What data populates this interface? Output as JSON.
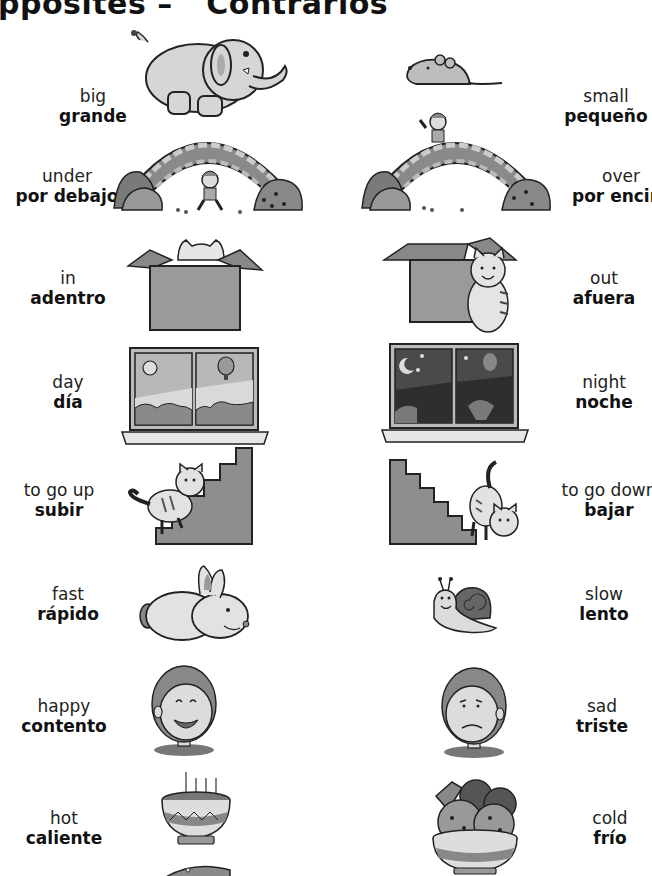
{
  "page": {
    "title_left": "pposites",
    "title_right": "Contrarios"
  },
  "colors": {
    "background": "#ffffff",
    "text": "#111111",
    "light_gray": "#d6d6d6",
    "mid_gray": "#9a9a9a",
    "dark_gray": "#6e6e6e",
    "outline": "#222222"
  },
  "pairs": [
    {
      "left": {
        "en": "big",
        "es": "grande",
        "picture": "elephant-icon"
      },
      "right": {
        "en": "small",
        "es": "pequeño",
        "picture": "mouse-icon"
      }
    },
    {
      "left": {
        "en": "under",
        "es": "por debajo",
        "picture": "boy-under-bridge-icon"
      },
      "right": {
        "en": "over",
        "es": "por encim",
        "picture": "boy-over-bridge-icon"
      }
    },
    {
      "left": {
        "en": "in",
        "es": "adentro",
        "picture": "cat-in-box-icon"
      },
      "right": {
        "en": "out",
        "es": "afuera",
        "picture": "cat-out-of-box-icon"
      }
    },
    {
      "left": {
        "en": "day",
        "es": "día",
        "picture": "day-window-icon"
      },
      "right": {
        "en": "night",
        "es": "noche",
        "picture": "night-window-icon"
      }
    },
    {
      "left": {
        "en": "to go up",
        "es": "subir",
        "picture": "cat-climbing-stairs-icon"
      },
      "right": {
        "en": "to go down",
        "es": "bajar",
        "picture": "cat-descending-stairs-icon"
      }
    },
    {
      "left": {
        "en": "fast",
        "es": "rápido",
        "picture": "rabbit-icon"
      },
      "right": {
        "en": "slow",
        "es": "lento",
        "picture": "snail-icon"
      }
    },
    {
      "left": {
        "en": "happy",
        "es": "contento",
        "picture": "happy-boy-icon"
      },
      "right": {
        "en": "sad",
        "es": "triste",
        "picture": "sad-boy-icon"
      }
    },
    {
      "left": {
        "en": "hot",
        "es": "caliente",
        "picture": "hot-soup-bowl-icon"
      },
      "right": {
        "en": "cold",
        "es": "frío",
        "picture": "ice-cream-bowl-icon"
      }
    }
  ]
}
